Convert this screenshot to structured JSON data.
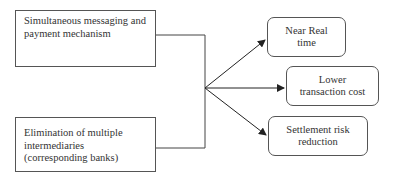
{
  "diagram": {
    "inputs": [
      {
        "id": "simultaneous",
        "lines": [
          "Simultaneous messaging and",
          "payment mechanism"
        ]
      },
      {
        "id": "elimination",
        "lines": [
          "Elimination of multiple",
          "intermediaries",
          "(corresponding banks)"
        ]
      }
    ],
    "outputs": [
      {
        "id": "near-real-time",
        "lines": [
          "Near Real",
          "time"
        ]
      },
      {
        "id": "lower-cost",
        "lines": [
          "Lower",
          "transaction cost"
        ]
      },
      {
        "id": "settlement-risk",
        "lines": [
          "Settlement risk",
          "reduction"
        ]
      }
    ],
    "colors": {
      "line": "#333333",
      "border": "#555555",
      "text": "#333333"
    }
  }
}
